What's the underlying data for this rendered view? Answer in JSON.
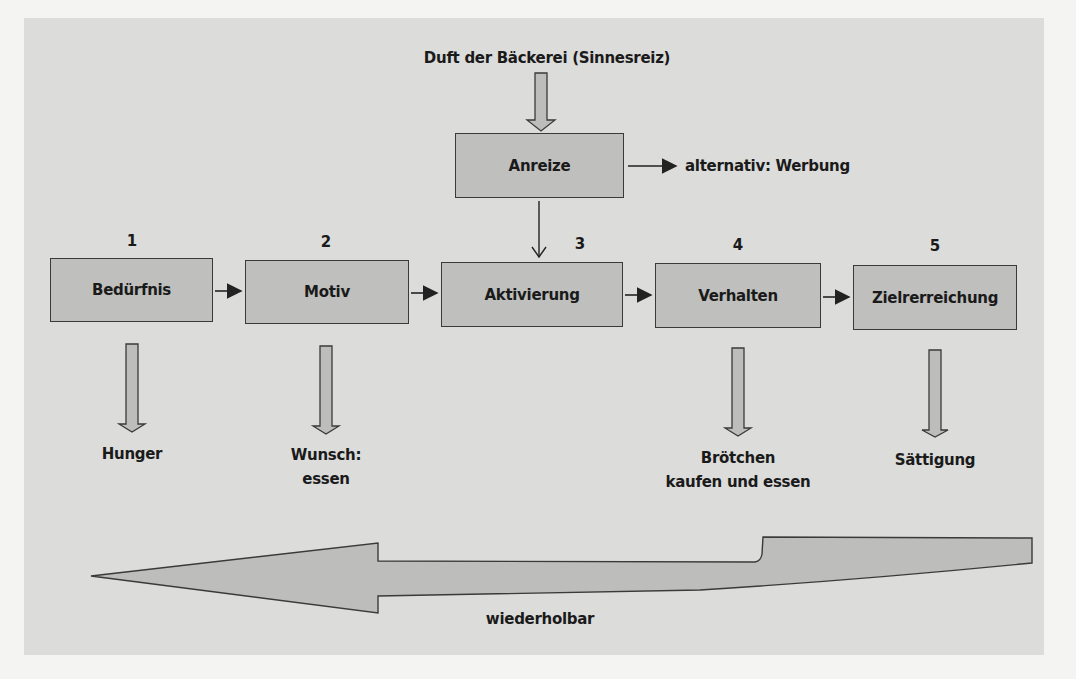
{
  "diagram": {
    "stimulus_label": "Duft der Bäckerei (Sinnesreiz)",
    "incentive_box": "Anreize",
    "alternative_label": "alternativ: Werbung",
    "steps": [
      {
        "number": "1",
        "label": "Bedürfnis",
        "result_lines": [
          "Hunger"
        ]
      },
      {
        "number": "2",
        "label": "Motiv",
        "result_lines": [
          "Wunsch:",
          "essen"
        ]
      },
      {
        "number": "3",
        "label": "Aktivierung",
        "result_lines": []
      },
      {
        "number": "4",
        "label": "Verhalten",
        "result_lines": [
          "Brötchen",
          "kaufen und essen"
        ]
      },
      {
        "number": "5",
        "label": "Zielrerreichung",
        "result_lines": [
          "Sättigung"
        ]
      }
    ],
    "cycle_label": "wiederholbar",
    "colors": {
      "background": "#dcdcda",
      "box_fill": "#bfbfbd",
      "stroke": "#3a3a3a",
      "arrow_fill": "#bdbdbb"
    }
  }
}
